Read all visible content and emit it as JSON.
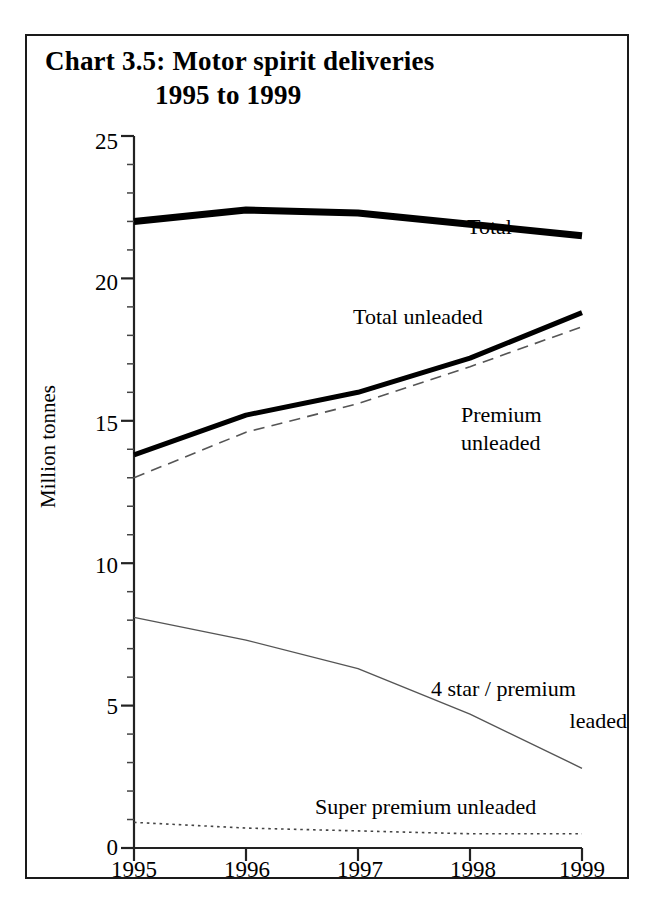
{
  "figure": {
    "title_line_1": "Chart 3.5: Motor spirit deliveries",
    "title_line_2": "1995 to 1999",
    "border_color": "#1a1a1a"
  },
  "chart_data": {
    "type": "line",
    "title": "Chart 3.5: Motor spirit deliveries 1995 to 1999",
    "xlabel": "",
    "ylabel": "Million tonnes",
    "categories": [
      "1995",
      "1996",
      "1997",
      "1998",
      "1999"
    ],
    "x": [
      1995,
      1996,
      1997,
      1998,
      1999
    ],
    "xlim": [
      1995,
      1999
    ],
    "ylim": [
      0,
      25
    ],
    "yticks": [
      0,
      5,
      10,
      15,
      20,
      25
    ],
    "ytick_labels": [
      "0",
      "5",
      "10",
      "15",
      "20",
      "25"
    ],
    "minor_ticks": true,
    "grid": false,
    "legend": "inline-annotations",
    "series": [
      {
        "name": "Total",
        "values": [
          22.0,
          22.4,
          22.3,
          21.9,
          21.5
        ],
        "style": "solid",
        "width": 7,
        "color": "#000000",
        "label": "Total"
      },
      {
        "name": "Total unleaded",
        "values": [
          13.8,
          15.2,
          16.0,
          17.2,
          18.8
        ],
        "style": "solid",
        "width": 5,
        "color": "#000000",
        "label": "Total unleaded"
      },
      {
        "name": "Premium unleaded",
        "values": [
          13.0,
          14.6,
          15.6,
          16.9,
          18.3
        ],
        "style": "dashed",
        "width": 1.6,
        "color": "#555555",
        "label": "Premium unleaded",
        "label_line_1": "Premium",
        "label_line_2": "unleaded"
      },
      {
        "name": "4 star / premium leaded",
        "values": [
          8.1,
          7.3,
          6.3,
          4.7,
          2.8
        ],
        "style": "thin-solid",
        "width": 1.4,
        "color": "#555555",
        "label": "4 star / premium leaded",
        "label_line_1": "4 star / premium",
        "label_line_2": "leaded"
      },
      {
        "name": "Super premium unleaded",
        "values": [
          0.9,
          0.7,
          0.6,
          0.5,
          0.5
        ],
        "style": "dotted",
        "width": 1.6,
        "color": "#444444",
        "label": "Super premium unleaded"
      }
    ]
  },
  "axis": {
    "y_title": "Million tonnes",
    "y_labels": [
      "25",
      "20",
      "15",
      "10",
      "5",
      "0"
    ],
    "x_labels": [
      "1995",
      "1996",
      "1997",
      "1998",
      "1999"
    ]
  },
  "annotations": {
    "total": "Total",
    "total_unleaded": "Total unleaded",
    "premium_unleaded_1": "Premium",
    "premium_unleaded_2": "unleaded",
    "leaded_1": "4 star / premium",
    "leaded_2": "leaded",
    "super_premium_unleaded": "Super premium unleaded"
  }
}
